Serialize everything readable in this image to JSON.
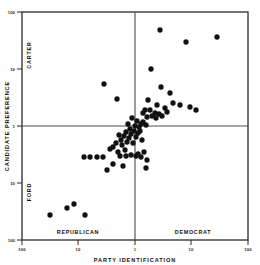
{
  "chart_data": {
    "type": "scatter",
    "title": "",
    "xlabel": "PARTY IDENTIFICATION",
    "ylabel": "CANDIDATE PREFERENCE",
    "xscale": "log-symmetric",
    "yscale": "log-symmetric",
    "grid": false,
    "legend": null,
    "x_tick_labels": [
      "100",
      "10",
      "1",
      "10",
      "100"
    ],
    "y_tick_labels": [
      "100",
      "10",
      "1",
      "10",
      "100"
    ],
    "x_axis_left_label": "REPUBLICAN",
    "x_axis_right_label": "DEMOCRAT",
    "y_axis_top_label": "CARTER",
    "y_axis_bottom_label": "FORD",
    "marker": {
      "shape": "circle",
      "color": "#111111",
      "size_px": 3.1
    },
    "reference_lines": {
      "vertical_at": "1",
      "horizontal_at": "1"
    },
    "points": [
      [
        160,
        30
      ],
      [
        217,
        37
      ],
      [
        186,
        42
      ],
      [
        151,
        69
      ],
      [
        104,
        84
      ],
      [
        161,
        87
      ],
      [
        117,
        99
      ],
      [
        170,
        93
      ],
      [
        173,
        103
      ],
      [
        148,
        100
      ],
      [
        157,
        105
      ],
      [
        180,
        105
      ],
      [
        165,
        108
      ],
      [
        150,
        110
      ],
      [
        143,
        113
      ],
      [
        167,
        112
      ],
      [
        155,
        113
      ],
      [
        159,
        114
      ],
      [
        152,
        116
      ],
      [
        162,
        116
      ],
      [
        147,
        117
      ],
      [
        156,
        118
      ],
      [
        145,
        110
      ],
      [
        190,
        107
      ],
      [
        196,
        110
      ],
      [
        137,
        121
      ],
      [
        132,
        118
      ],
      [
        141,
        124
      ],
      [
        128,
        124
      ],
      [
        135,
        126
      ],
      [
        139,
        127
      ],
      [
        130,
        129
      ],
      [
        143,
        122
      ],
      [
        146,
        125
      ],
      [
        134,
        131
      ],
      [
        126,
        132
      ],
      [
        131,
        134
      ],
      [
        124,
        136
      ],
      [
        138,
        133
      ],
      [
        129,
        138
      ],
      [
        121,
        140
      ],
      [
        136,
        137
      ],
      [
        140,
        131
      ],
      [
        119,
        135
      ],
      [
        127,
        142
      ],
      [
        133,
        143
      ],
      [
        122,
        145
      ],
      [
        116,
        143
      ],
      [
        142,
        140
      ],
      [
        113,
        147
      ],
      [
        125,
        150
      ],
      [
        118,
        152
      ],
      [
        110,
        149
      ],
      [
        144,
        152
      ],
      [
        131,
        155
      ],
      [
        138,
        154
      ],
      [
        90,
        157
      ],
      [
        97,
        157
      ],
      [
        103,
        157
      ],
      [
        84,
        157
      ],
      [
        120,
        156
      ],
      [
        126,
        156
      ],
      [
        136,
        156
      ],
      [
        141,
        157
      ],
      [
        147,
        160
      ],
      [
        113,
        164
      ],
      [
        123,
        166
      ],
      [
        107,
        170
      ],
      [
        146,
        168
      ],
      [
        74,
        204
      ],
      [
        67,
        208
      ],
      [
        50,
        215
      ],
      [
        85,
        215
      ]
    ]
  }
}
